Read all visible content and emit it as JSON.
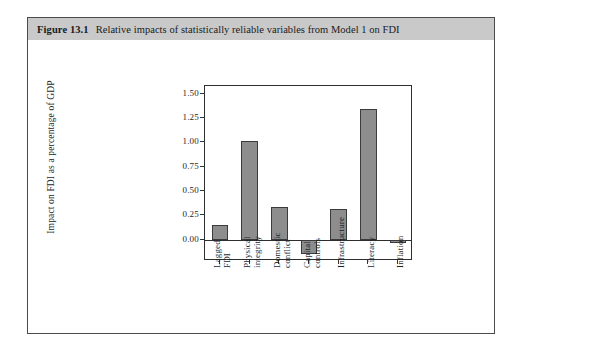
{
  "figure": {
    "number": "Figure 13.1",
    "caption": "Relative impacts of statistically reliable variables from Model 1 on FDI"
  },
  "chart_data": {
    "type": "bar",
    "title": "",
    "xlabel": "",
    "ylabel": "Impact on FDI as a percentage of GDP",
    "categories": [
      "Lagged\nFDI",
      "Physical\nintegrity",
      "Domestic\nconflict",
      "Capital\ncontrols",
      "Infrastructure",
      "Literacy",
      "Inflation"
    ],
    "values": [
      0.15,
      1.01,
      0.34,
      -0.145,
      0.32,
      1.34,
      -0.04
    ],
    "ytick_labels": [
      "0.00",
      "0.25",
      "0.50",
      "0.75",
      "1.00",
      "1.25",
      "1.50"
    ],
    "ytick_values": [
      0.0,
      0.25,
      0.5,
      0.75,
      1.0,
      1.25,
      1.5
    ],
    "ylim": [
      -0.22,
      1.58
    ],
    "grid": false,
    "legend": "none",
    "bar_color": "#8d8d8d",
    "bar_edge_color": "#3b3b3b"
  }
}
